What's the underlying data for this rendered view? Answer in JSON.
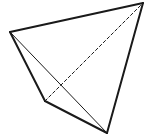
{
  "diagram": {
    "type": "tetrahedron",
    "background": "#ffffff",
    "stroke_color": "#1a1a1a",
    "vertices": {
      "left": [
        10,
        32
      ],
      "top_right": [
        143,
        3
      ],
      "bottom_left": [
        45,
        101
      ],
      "bottom": [
        107,
        133
      ]
    },
    "edges": [
      {
        "from": "left",
        "to": "top_right",
        "style": "solid",
        "width": 2
      },
      {
        "from": "left",
        "to": "bottom_left",
        "style": "solid",
        "width": 2
      },
      {
        "from": "bottom_left",
        "to": "bottom",
        "style": "solid",
        "width": 2
      },
      {
        "from": "bottom",
        "to": "top_right",
        "style": "solid",
        "width": 2
      },
      {
        "from": "left",
        "to": "bottom",
        "style": "solid",
        "width": 1
      },
      {
        "from": "bottom_left",
        "to": "top_right",
        "style": "dashed",
        "width": 1
      }
    ]
  }
}
